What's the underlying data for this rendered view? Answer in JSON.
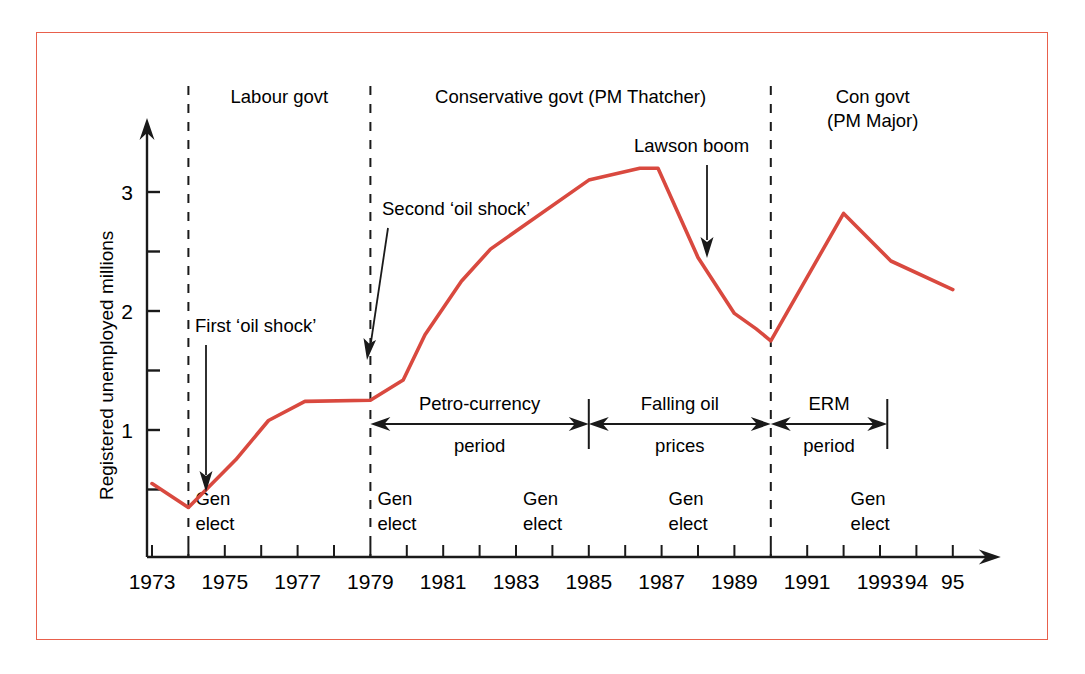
{
  "figure": {
    "border_color": "#e8604c",
    "line_color": "#d9493f",
    "axis_color": "#1a1a1a",
    "background": "#ffffff"
  },
  "axes": {
    "y_axis_title": "Registered unemployed millions",
    "y_major_ticks": [
      "1",
      "2",
      "3"
    ],
    "y_major_values": [
      1,
      2,
      3
    ],
    "y_minor_values": [
      0.5,
      1.5,
      2.5
    ],
    "x_tick_labels": [
      "1973",
      "1975",
      "1977",
      "1979",
      "1981",
      "1983",
      "1985",
      "1987",
      "1989",
      "1991",
      "1993",
      "94",
      "95"
    ],
    "x_tick_values": [
      1973,
      1975,
      1977,
      1979,
      1981,
      1983,
      1985,
      1987,
      1989,
      1991,
      1993,
      1994,
      1995
    ]
  },
  "government_periods": [
    {
      "label": "Labour govt",
      "start": 1974,
      "end": 1979
    },
    {
      "label": "Conservative govt (PM Thatcher)",
      "start": 1979,
      "end": 1990
    },
    {
      "label": "Con govt\n(PM Major)",
      "start": 1990,
      "end": 1995.6
    }
  ],
  "election_markers": [
    {
      "label": "Gen\nelect",
      "year": 1974
    },
    {
      "label": "Gen\nelect",
      "year": 1979
    },
    {
      "label": "Gen\nelect",
      "year": 1983
    },
    {
      "label": "Gen\nelect",
      "year": 1987
    },
    {
      "label": "Gen\nelect",
      "year": 1992
    }
  ],
  "dashed_dividers": [
    1974,
    1979,
    1990
  ],
  "annotations": [
    {
      "name": "first-oil-shock",
      "label": "First ‘oil shock’",
      "arrow_to_year": 1974.2
    },
    {
      "name": "second-oil-shock",
      "label": "Second ‘oil shock’",
      "arrow_to_year": 1979.0
    },
    {
      "name": "lawson-boom",
      "label": "Lawson boom",
      "arrow_to_year": 1988.0
    }
  ],
  "span_bars": [
    {
      "name": "petro-currency",
      "label": "Petro-currency\nperiod",
      "start": 1979,
      "end": 1985
    },
    {
      "name": "falling-oil-prices",
      "label": "Falling oil\nprices",
      "start": 1985,
      "end": 1990
    },
    {
      "name": "erm-period",
      "label": "ERM\nperiod",
      "start": 1990,
      "end": 1993.2
    }
  ],
  "chart_data": {
    "type": "line",
    "title": "",
    "subtitle": "",
    "xlabel": "",
    "ylabel": "Registered unemployed millions",
    "xlim": [
      1972.6,
      1995.9
    ],
    "ylim": [
      0,
      3.55
    ],
    "grid": false,
    "legend": "none",
    "series": [
      {
        "name": "Registered unemployed (millions)",
        "color": "#d9493f",
        "x": [
          1973.0,
          1974.0,
          1975.3,
          1976.2,
          1977.2,
          1979.0,
          1979.9,
          1980.5,
          1981.5,
          1982.3,
          1985.0,
          1986.4,
          1986.9,
          1988.0,
          1989.0,
          1989.6,
          1990.0,
          1992.0,
          1993.3,
          1995.0
        ],
        "y": [
          0.55,
          0.35,
          0.75,
          1.08,
          1.24,
          1.25,
          1.42,
          1.8,
          2.25,
          2.52,
          3.1,
          3.2,
          3.2,
          2.45,
          1.98,
          1.85,
          1.75,
          2.82,
          2.42,
          2.18
        ],
        "x_labels": [
          "1973",
          "1974",
          "1975",
          "1976",
          "1977",
          "1979",
          "1980",
          "1980.5",
          "1981.5",
          "1982",
          "1985",
          "1986",
          "1987",
          "1988",
          "1989",
          "1989.5",
          "1990",
          "1992",
          "1993",
          "1995"
        ]
      }
    ]
  }
}
